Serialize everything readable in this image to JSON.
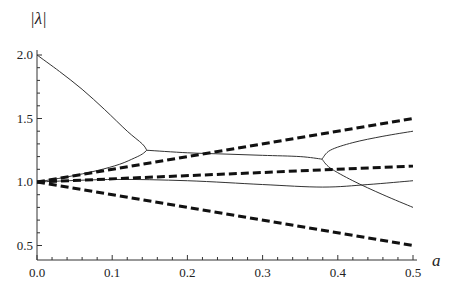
{
  "chart_data": {
    "type": "line",
    "title": "",
    "xlabel": "a",
    "ylabel": "|λ|",
    "xlim": [
      0.0,
      0.5
    ],
    "ylim": [
      0.45,
      2.05
    ],
    "x_ticks": [
      "0.0",
      "0.1",
      "0.2",
      "0.3",
      "0.4",
      "0.5"
    ],
    "y_ticks": [
      "0.5",
      "1.0",
      "1.5",
      "2.0"
    ],
    "grid": false,
    "legend": null,
    "series": [
      {
        "name": "solid-upper-start",
        "style": "solid",
        "x": [
          0.0,
          0.03,
          0.06,
          0.09,
          0.12,
          0.14,
          0.146
        ],
        "y": [
          2.0,
          1.87,
          1.73,
          1.57,
          1.4,
          1.3,
          1.25
        ]
      },
      {
        "name": "solid-lower-start",
        "style": "solid",
        "x": [
          0.0,
          0.04,
          0.08,
          0.11,
          0.13,
          0.14,
          0.146
        ],
        "y": [
          1.0,
          1.04,
          1.09,
          1.14,
          1.19,
          1.22,
          1.25
        ]
      },
      {
        "name": "solid-middle",
        "style": "solid",
        "x": [
          0.146,
          0.2,
          0.25,
          0.3,
          0.35,
          0.379
        ],
        "y": [
          1.25,
          1.23,
          1.22,
          1.21,
          1.2,
          1.18
        ]
      },
      {
        "name": "solid-branch-up",
        "style": "solid",
        "x": [
          0.379,
          0.39,
          0.42,
          0.46,
          0.5
        ],
        "y": [
          1.18,
          1.25,
          1.31,
          1.36,
          1.4
        ]
      },
      {
        "name": "solid-branch-down",
        "style": "solid",
        "x": [
          0.379,
          0.39,
          0.42,
          0.46,
          0.5
        ],
        "y": [
          1.18,
          1.11,
          1.01,
          0.9,
          0.8
        ]
      },
      {
        "name": "solid-near-one",
        "style": "solid",
        "x": [
          0.0,
          0.1,
          0.2,
          0.3,
          0.38,
          0.44,
          0.5
        ],
        "y": [
          1.0,
          1.02,
          1.01,
          0.98,
          0.96,
          0.98,
          1.01
        ]
      },
      {
        "name": "dashed-upper",
        "style": "dashed",
        "x": [
          0.0,
          0.5
        ],
        "y": [
          1.0,
          1.5
        ]
      },
      {
        "name": "dashed-middle",
        "style": "dashed",
        "x": [
          0.0,
          0.5
        ],
        "y": [
          1.0,
          1.125
        ]
      },
      {
        "name": "dashed-lower",
        "style": "dashed",
        "x": [
          0.0,
          0.5
        ],
        "y": [
          1.0,
          0.5
        ]
      }
    ]
  },
  "plot": {
    "line_color": "#333333",
    "dash_color": "#111111",
    "axis_color": "#333333"
  }
}
